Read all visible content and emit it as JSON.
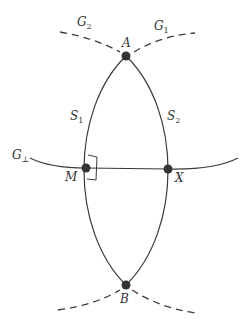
{
  "diagram": {
    "colors": {
      "stroke": "#3a3a3a",
      "point": "#333333",
      "background": "#ffffff"
    },
    "points": {
      "A": {
        "label": "A",
        "x": 126,
        "y": 56
      },
      "B": {
        "label": "B",
        "x": 126,
        "y": 285
      },
      "M": {
        "label": "M",
        "x": 86,
        "y": 168
      },
      "X": {
        "label": "X",
        "x": 168,
        "y": 169
      }
    },
    "curves": {
      "G1": {
        "label": "G",
        "sub": "1",
        "style": "dashed"
      },
      "G2": {
        "label": "G",
        "sub": "2",
        "style": "dashed"
      },
      "S1": {
        "label": "S",
        "sub": "1",
        "style": "solid"
      },
      "S2": {
        "label": "S",
        "sub": "2",
        "style": "solid"
      },
      "Gperp": {
        "label": "G",
        "sub": "⊥",
        "style": "solid"
      }
    },
    "annotations": {
      "right_angle_at": "M"
    }
  }
}
